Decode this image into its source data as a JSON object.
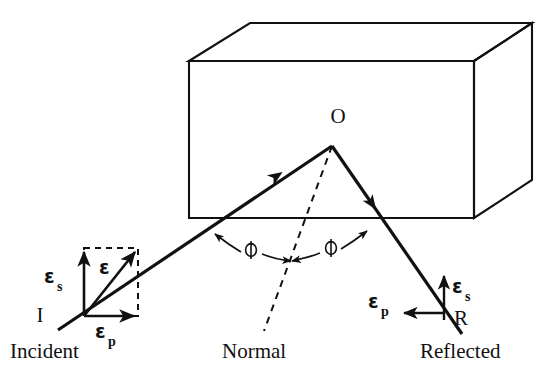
{
  "figure": {
    "kind": "optics-reflection-diagram",
    "background_color": "#ffffff",
    "ink_color": "#111111",
    "width": 550,
    "height": 374
  },
  "labels": {
    "origin_point": "O",
    "incident_point": "I",
    "reflected_point": "R",
    "incident_caption": "Incident",
    "reflected_caption": "Reflected",
    "normal_caption": "Normal",
    "angle_left": "ϕ",
    "angle_right": "ϕ",
    "eps_resultant": "ε",
    "eps_s_incident": "ε",
    "eps_s_incident_sub": "s",
    "eps_p_incident": "ε",
    "eps_p_incident_sub": "p",
    "eps_s_reflected": "ε",
    "eps_s_reflected_sub": "s",
    "eps_p_reflected": "ε",
    "eps_p_reflected_sub": "p"
  },
  "geometry": {
    "box": {
      "front_face": "189,61 474,61 474,218 189,218",
      "top_face": "189,61 250,23 532,23 474,61",
      "right_face": "474,61 532,23 532,180 474,218"
    },
    "incident_ray": {
      "x1": 58,
      "y1": 330,
      "x2": 332,
      "y2": 146
    },
    "reflected_ray": {
      "x1": 332,
      "y1": 146,
      "x2": 462,
      "y2": 334
    },
    "normal_line": {
      "x1": 332,
      "y1": 146,
      "x2": 264,
      "y2": 331
    },
    "vector_origin": {
      "x": 84,
      "y": 316
    },
    "dashed_rect": {
      "x": 84,
      "y": 248,
      "width": 54,
      "height": 68
    },
    "eps_s_inc_arrow": {
      "x1": 84,
      "y1": 316,
      "x2": 84,
      "y2": 250
    },
    "eps_p_inc_arrow": {
      "x1": 84,
      "y1": 316,
      "x2": 136,
      "y2": 316
    },
    "eps_res_arrow": {
      "x1": 84,
      "y1": 316,
      "x2": 136,
      "y2": 250
    },
    "eps_s_ref_arrow": {
      "x1": 444,
      "y1": 320,
      "x2": 444,
      "y2": 274
    },
    "eps_p_ref_arrow": {
      "x1": 444,
      "y1": 313,
      "x2": 402,
      "y2": 313
    }
  },
  "label_positions": {
    "origin_point": {
      "x": 338,
      "y": 123
    },
    "incident_point": {
      "x": 40,
      "y": 322
    },
    "reflected_point": {
      "x": 461,
      "y": 325
    },
    "incident_caption": {
      "x": 10,
      "y": 358
    },
    "normal_caption": {
      "x": 222,
      "y": 358
    },
    "reflected_caption": {
      "x": 420,
      "y": 358
    },
    "angle_left": {
      "x": 245,
      "y": 255
    },
    "angle_right": {
      "x": 336,
      "y": 255
    },
    "eps_resultant": {
      "x": 102,
      "y": 272
    },
    "eps_s_incident": {
      "x": 50,
      "y": 283
    },
    "eps_p_incident": {
      "x": 98,
      "y": 336
    },
    "eps_s_reflected": {
      "x": 455,
      "y": 293
    },
    "eps_p_reflected": {
      "x": 370,
      "y": 307
    }
  }
}
